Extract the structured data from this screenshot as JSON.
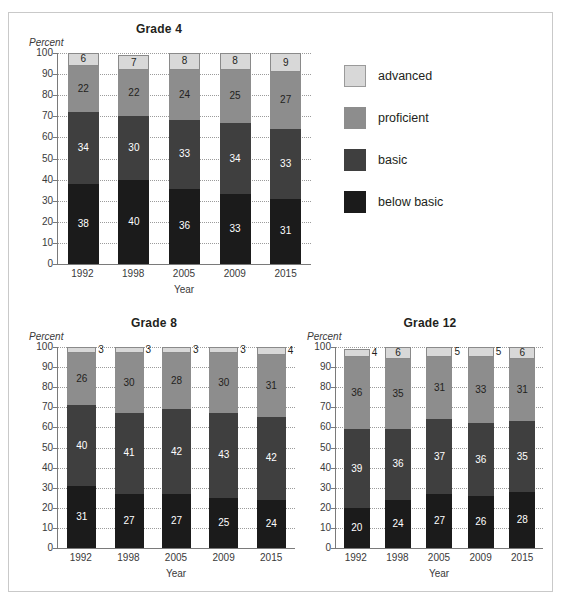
{
  "legend": {
    "items": [
      {
        "key": "advanced",
        "label": "advanced",
        "color": "#d8d8d8"
      },
      {
        "key": "proficient",
        "label": "proficient",
        "color": "#8d8d8d"
      },
      {
        "key": "basic",
        "label": "basic",
        "color": "#3f3f3f"
      },
      {
        "key": "below_basic",
        "label": "below basic",
        "color": "#1b1b1b"
      }
    ]
  },
  "chart_data": [
    {
      "type": "bar",
      "stacked": true,
      "title": "Grade 4",
      "xlabel": "Year",
      "ylabel": "Percent",
      "ylim": [
        0,
        100
      ],
      "yticks": [
        "0",
        "10",
        "20",
        "30",
        "40",
        "50",
        "60",
        "70",
        "80",
        "90",
        "100"
      ],
      "grid": true,
      "legend_position": "right",
      "categories": [
        "1992",
        "1998",
        "2005",
        "2009",
        "2015"
      ],
      "series": [
        {
          "name": "below basic",
          "values": [
            38,
            40,
            36,
            33,
            31
          ]
        },
        {
          "name": "basic",
          "values": [
            34,
            30,
            33,
            34,
            33
          ]
        },
        {
          "name": "proficient",
          "values": [
            22,
            22,
            24,
            25,
            27
          ]
        },
        {
          "name": "advanced",
          "values": [
            6,
            7,
            8,
            8,
            9
          ]
        }
      ]
    },
    {
      "type": "bar",
      "stacked": true,
      "title": "Grade 8",
      "xlabel": "Year",
      "ylabel": "Percent",
      "ylim": [
        0,
        100
      ],
      "yticks": [
        "0",
        "10",
        "20",
        "30",
        "40",
        "50",
        "60",
        "70",
        "80",
        "90",
        "100"
      ],
      "grid": true,
      "categories": [
        "1992",
        "1998",
        "2005",
        "2009",
        "2015"
      ],
      "series": [
        {
          "name": "below basic",
          "values": [
            31,
            27,
            27,
            25,
            24
          ]
        },
        {
          "name": "basic",
          "values": [
            40,
            41,
            42,
            43,
            42
          ]
        },
        {
          "name": "proficient",
          "values": [
            26,
            30,
            28,
            30,
            31
          ]
        },
        {
          "name": "advanced",
          "values": [
            3,
            3,
            3,
            3,
            4
          ]
        }
      ]
    },
    {
      "type": "bar",
      "stacked": true,
      "title": "Grade 12",
      "xlabel": "Year",
      "ylabel": "Percent",
      "ylim": [
        0,
        100
      ],
      "yticks": [
        "0",
        "10",
        "20",
        "30",
        "40",
        "50",
        "60",
        "70",
        "80",
        "90",
        "100"
      ],
      "grid": true,
      "categories": [
        "1992",
        "1998",
        "2005",
        "2009",
        "2015"
      ],
      "series": [
        {
          "name": "below basic",
          "values": [
            20,
            24,
            27,
            26,
            28
          ]
        },
        {
          "name": "basic",
          "values": [
            39,
            36,
            37,
            36,
            35
          ]
        },
        {
          "name": "proficient",
          "values": [
            36,
            35,
            31,
            33,
            31
          ]
        },
        {
          "name": "advanced",
          "values": [
            4,
            6,
            5,
            5,
            6
          ]
        }
      ]
    }
  ]
}
